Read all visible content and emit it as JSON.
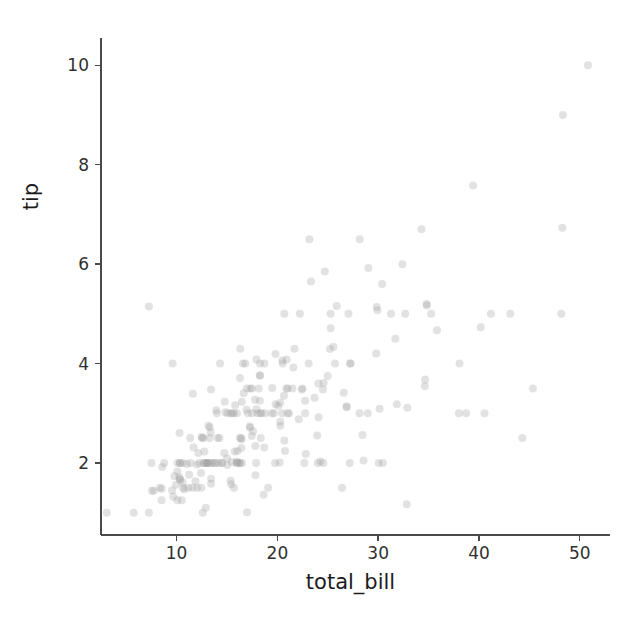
{
  "figure": {
    "width": 640,
    "height": 622,
    "background": "#ffffff",
    "marker_color": "#9e9e9e",
    "marker_alpha": 0.3,
    "spine_color": "#4a4a4a",
    "text_color": "#1c1c1c"
  },
  "chart_data": {
    "type": "scatter",
    "title": "",
    "xlabel": "total_bill",
    "ylabel": "tip",
    "xlim": [
      2.5,
      53.0
    ],
    "ylim": [
      0.55,
      10.55
    ],
    "xticks": [
      10,
      20,
      30,
      40,
      50
    ],
    "yticks": [
      2,
      4,
      6,
      8,
      10
    ],
    "xtick_labels": [
      "10",
      "20",
      "30",
      "40",
      "50"
    ],
    "ytick_labels": [
      "2",
      "4",
      "6",
      "8",
      "10"
    ],
    "grid": false,
    "legend": null,
    "n_points": 244,
    "series": [
      {
        "name": "tips",
        "marker": "circle",
        "color": "#9e9e9e",
        "alpha": 0.3,
        "size": 8,
        "x": [
          16.99,
          10.34,
          21.01,
          23.68,
          24.59,
          25.29,
          8.77,
          26.88,
          15.04,
          14.78,
          10.27,
          35.26,
          15.42,
          18.43,
          14.83,
          21.58,
          10.33,
          16.29,
          16.97,
          20.65,
          17.92,
          20.29,
          15.77,
          39.42,
          19.82,
          17.81,
          13.37,
          12.69,
          21.7,
          19.65,
          9.55,
          18.35,
          15.06,
          20.69,
          17.78,
          24.06,
          16.31,
          16.93,
          18.69,
          31.27,
          16.04,
          17.46,
          13.94,
          9.68,
          30.4,
          18.29,
          22.23,
          32.4,
          28.55,
          18.04,
          12.54,
          10.29,
          34.81,
          9.94,
          25.56,
          19.49,
          38.01,
          26.41,
          11.24,
          48.27,
          20.29,
          13.81,
          11.02,
          18.29,
          17.59,
          20.08,
          16.45,
          3.07,
          20.23,
          15.01,
          12.02,
          17.07,
          26.86,
          25.28,
          14.73,
          10.51,
          17.92,
          27.2,
          22.76,
          17.29,
          19.44,
          16.66,
          10.07,
          32.68,
          15.98,
          34.83,
          13.03,
          18.28,
          24.71,
          21.16,
          28.97,
          22.49,
          5.75,
          16.32,
          22.75,
          40.17,
          27.28,
          12.03,
          21.01,
          12.46,
          11.35,
          15.38,
          44.3,
          22.42,
          20.92,
          15.36,
          20.49,
          25.21,
          18.24,
          14.31,
          14.0,
          7.25,
          38.07,
          23.95,
          25.71,
          17.31,
          29.93,
          10.65,
          12.43,
          24.08,
          11.69,
          13.42,
          14.26,
          15.95,
          12.48,
          29.8,
          8.52,
          14.52,
          11.38,
          22.82,
          19.08,
          20.27,
          11.17,
          12.26,
          18.26,
          8.51,
          10.33,
          14.15,
          16.0,
          13.16,
          17.47,
          34.3,
          41.19,
          27.05,
          16.43,
          8.35,
          18.64,
          11.87,
          9.78,
          7.51,
          14.07,
          13.13,
          17.26,
          24.55,
          19.77,
          29.85,
          48.17,
          25.0,
          13.39,
          16.49,
          21.5,
          12.66,
          16.21,
          13.81,
          17.51,
          24.52,
          20.76,
          31.71,
          10.59,
          10.63,
          50.81,
          15.81,
          7.25,
          31.85,
          16.82,
          32.9,
          17.89,
          14.48,
          9.6,
          34.63,
          34.65,
          23.33,
          45.35,
          23.17,
          40.55,
          20.69,
          20.9,
          30.46,
          18.15,
          23.1,
          15.69,
          19.81,
          28.44,
          15.48,
          16.58,
          7.56,
          10.34,
          43.11,
          13.0,
          13.51,
          18.71,
          12.74,
          13.0,
          16.4,
          20.53,
          16.47,
          26.59,
          38.73,
          24.27,
          12.76,
          30.06,
          25.89,
          48.33,
          13.27,
          28.17,
          12.9,
          28.15,
          11.59,
          7.74,
          30.14,
          12.16,
          13.42,
          8.58,
          15.98,
          13.42,
          16.27,
          10.09,
          20.45,
          13.28,
          22.12,
          24.01,
          15.69,
          11.61,
          10.77,
          15.53,
          10.07,
          12.6,
          32.83,
          35.83,
          29.03,
          27.18,
          22.67,
          17.82,
          18.78
        ],
        "y": [
          1.01,
          1.66,
          3.5,
          3.31,
          3.61,
          4.71,
          2.0,
          3.12,
          1.96,
          3.23,
          1.71,
          5.0,
          1.57,
          3.0,
          3.02,
          3.92,
          1.67,
          3.71,
          3.5,
          3.35,
          4.08,
          2.75,
          2.23,
          7.58,
          3.18,
          2.34,
          2.0,
          2.0,
          4.3,
          3.0,
          1.45,
          2.5,
          3.0,
          2.45,
          3.27,
          3.6,
          2.0,
          3.07,
          2.31,
          5.0,
          2.24,
          2.54,
          3.06,
          1.32,
          5.6,
          3.0,
          5.0,
          6.0,
          2.05,
          3.0,
          2.5,
          2.6,
          5.2,
          1.56,
          4.34,
          3.51,
          3.0,
          1.5,
          1.76,
          6.73,
          3.21,
          2.0,
          1.98,
          3.76,
          2.64,
          3.15,
          2.47,
          1.0,
          2.01,
          2.09,
          1.97,
          3.0,
          3.14,
          5.0,
          2.2,
          1.25,
          3.08,
          4.0,
          3.0,
          2.71,
          3.0,
          3.4,
          1.83,
          5.0,
          2.03,
          5.17,
          2.0,
          4.0,
          5.85,
          3.0,
          3.0,
          3.5,
          1.0,
          4.3,
          3.25,
          4.73,
          4.0,
          1.5,
          3.0,
          1.5,
          2.5,
          3.0,
          2.5,
          3.48,
          4.08,
          1.64,
          4.06,
          4.29,
          3.76,
          4.0,
          3.0,
          1.0,
          4.0,
          2.55,
          4.0,
          3.5,
          5.07,
          1.5,
          1.8,
          2.92,
          2.31,
          1.68,
          2.5,
          2.0,
          2.52,
          4.2,
          1.48,
          2.0,
          2.0,
          2.18,
          1.5,
          2.83,
          1.5,
          2.0,
          3.25,
          1.25,
          2.0,
          2.0,
          2.0,
          2.75,
          3.5,
          6.7,
          5.0,
          5.0,
          2.3,
          1.5,
          1.36,
          1.63,
          1.73,
          2.0,
          2.5,
          2.0,
          2.74,
          2.0,
          2.0,
          5.14,
          5.0,
          3.75,
          2.61,
          2.0,
          3.5,
          2.5,
          2.0,
          2.0,
          3.0,
          3.48,
          2.24,
          4.5,
          1.61,
          2.0,
          10.0,
          3.16,
          5.15,
          3.18,
          4.0,
          3.11,
          2.0,
          2.0,
          4.0,
          3.55,
          3.68,
          5.65,
          3.5,
          6.5,
          3.0,
          5.0,
          3.5,
          2.0,
          3.5,
          4.0,
          1.5,
          4.19,
          2.56,
          2.02,
          4.0,
          1.44,
          2.0,
          5.0,
          2.0,
          2.0,
          4.0,
          2.0,
          2.0,
          2.5,
          4.0,
          3.23,
          3.41,
          3.0,
          2.03,
          2.23,
          2.0,
          5.16,
          9.0,
          2.5,
          6.5,
          1.1,
          3.0,
          1.5,
          1.44,
          3.09,
          2.2,
          3.48,
          1.92,
          3.0,
          1.58,
          2.5,
          2.0,
          3.0,
          2.72,
          2.88,
          2.0,
          3.0,
          3.39,
          1.47,
          3.0,
          1.25,
          1.0,
          1.17,
          4.67,
          5.92,
          2.0,
          2.0,
          1.75,
          3.0
        ]
      }
    ]
  },
  "axes": {
    "geometry": {
      "left": 101,
      "right": 610,
      "top": 38,
      "bottom": 535,
      "x_pixel_per_unit": 9.65,
      "y_pixel_per_unit": 50.1,
      "x_zero_pixel": 90.5,
      "y_zero_pixel": 562.2
    }
  }
}
